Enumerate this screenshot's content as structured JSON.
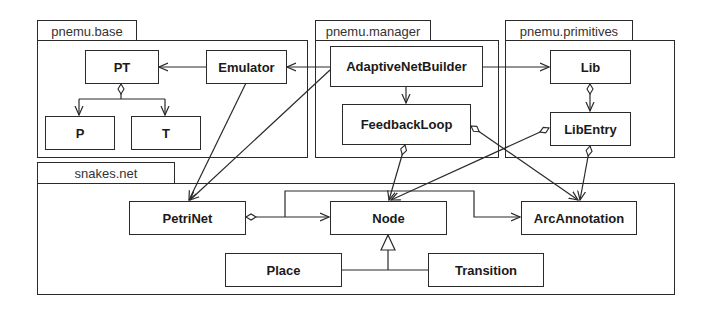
{
  "diagram": {
    "type": "UML class/package diagram",
    "packages": [
      {
        "id": "base",
        "label": "pnemu.base"
      },
      {
        "id": "manager",
        "label": "pnemu.manager"
      },
      {
        "id": "primitives",
        "label": "pnemu.primitives"
      },
      {
        "id": "snakes",
        "label": "snakes.net"
      }
    ],
    "classes": {
      "pt": "PT",
      "emulator": "Emulator",
      "p": "P",
      "t": "T",
      "adaptive_net_builder": "AdaptiveNetBuilder",
      "feedback_loop": "FeedbackLoop",
      "lib": "Lib",
      "lib_entry": "LibEntry",
      "petri_net": "PetriNet",
      "node": "Node",
      "arc_annotation": "ArcAnnotation",
      "place": "Place",
      "transition": "Transition"
    },
    "relations": [
      {
        "from": "Emulator",
        "to": "PT",
        "kind": "association"
      },
      {
        "from": "PT",
        "to": "P",
        "kind": "aggregation"
      },
      {
        "from": "PT",
        "to": "T",
        "kind": "aggregation"
      },
      {
        "from": "AdaptiveNetBuilder",
        "to": "Emulator",
        "kind": "association"
      },
      {
        "from": "AdaptiveNetBuilder",
        "to": "Lib",
        "kind": "association"
      },
      {
        "from": "AdaptiveNetBuilder",
        "to": "FeedbackLoop",
        "kind": "association"
      },
      {
        "from": "AdaptiveNetBuilder",
        "to": "PetriNet",
        "kind": "association"
      },
      {
        "from": "Emulator",
        "to": "PetriNet",
        "kind": "association"
      },
      {
        "from": "Lib",
        "to": "LibEntry",
        "kind": "aggregation"
      },
      {
        "from": "FeedbackLoop",
        "to": "Node",
        "kind": "aggregation"
      },
      {
        "from": "FeedbackLoop",
        "to": "ArcAnnotation",
        "kind": "aggregation"
      },
      {
        "from": "LibEntry",
        "to": "Node",
        "kind": "aggregation"
      },
      {
        "from": "LibEntry",
        "to": "ArcAnnotation",
        "kind": "aggregation"
      },
      {
        "from": "PetriNet",
        "to": "Node",
        "kind": "aggregation"
      },
      {
        "from": "PetriNet",
        "to": "ArcAnnotation",
        "kind": "aggregation"
      },
      {
        "from": "Place",
        "to": "Node",
        "kind": "generalization"
      },
      {
        "from": "Transition",
        "to": "Node",
        "kind": "generalization"
      }
    ]
  }
}
